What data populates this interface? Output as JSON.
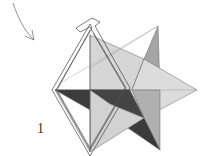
{
  "diagram": {
    "type": "origami-step-illustration",
    "step_label": "1",
    "elements": [
      "curved-arrow-pointing-down-right",
      "white-paper-strip-frame-wrapped-around-figure",
      "stellated-polyhedron-star-shape"
    ],
    "colors": {
      "light_face": "#d4d4d4",
      "mid_face": "#a8a8a8",
      "dark_face": "#3c3c3c",
      "line": "#555555",
      "strip": "#ffffff"
    }
  }
}
